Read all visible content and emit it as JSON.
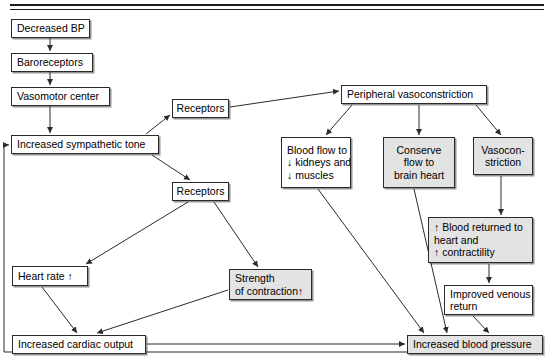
{
  "diagram": {
    "top_rule": "double-horizontal-rule",
    "box_fill_white": "#ffffff",
    "box_fill_gray": "#e3e3e3",
    "line_color": "#2b2b2b",
    "nodes": [
      {
        "id": "decreased_bp",
        "lines": [
          "Decreased BP"
        ],
        "x": 11,
        "y": 19,
        "w": 79,
        "h": 19,
        "fill": "white",
        "align": "left"
      },
      {
        "id": "baroreceptors",
        "lines": [
          "Baroreceptors"
        ],
        "x": 11,
        "y": 53,
        "w": 82,
        "h": 19,
        "fill": "white",
        "align": "left"
      },
      {
        "id": "vasomotor_center",
        "lines": [
          "Vasomotor center"
        ],
        "x": 11,
        "y": 87,
        "w": 99,
        "h": 19,
        "fill": "white",
        "align": "left"
      },
      {
        "id": "inc_symp_tone",
        "lines": [
          "Increased sympathetic tone"
        ],
        "x": 11,
        "y": 135,
        "w": 148,
        "h": 19,
        "fill": "white",
        "align": "left"
      },
      {
        "id": "receptors_upper",
        "lines": [
          "Receptors"
        ],
        "x": 172,
        "y": 99,
        "w": 57,
        "h": 19,
        "fill": "white",
        "align": "center"
      },
      {
        "id": "receptors_lower",
        "lines": [
          "Receptors"
        ],
        "x": 172,
        "y": 182,
        "w": 57,
        "h": 19,
        "fill": "white",
        "align": "center"
      },
      {
        "id": "periph_vasoconstr",
        "lines": [
          "Peripheral vasoconstriction"
        ],
        "x": 341,
        "y": 85,
        "w": 146,
        "h": 19,
        "fill": "white",
        "align": "left"
      },
      {
        "id": "blood_flow_down",
        "lines": [
          "Blood flow to",
          "↓ kidneys and",
          "↓ muscles"
        ],
        "x": 281,
        "y": 137,
        "w": 70,
        "h": 51,
        "fill": "white",
        "align": "left"
      },
      {
        "id": "conserve_flow",
        "lines": [
          "Conserve",
          "flow to",
          "brain heart"
        ],
        "x": 383,
        "y": 137,
        "w": 72,
        "h": 51,
        "fill": "gray",
        "align": "center"
      },
      {
        "id": "vasoconstriction",
        "lines": [
          "Vasocon-",
          "striction"
        ],
        "x": 473,
        "y": 137,
        "w": 60,
        "h": 38,
        "fill": "gray",
        "align": "center"
      },
      {
        "id": "blood_returned",
        "lines": [
          "↑ Blood returned to",
          "heart and",
          "↑ contractility"
        ],
        "x": 428,
        "y": 217,
        "w": 105,
        "h": 46,
        "fill": "gray",
        "align": "left"
      },
      {
        "id": "improved_venous",
        "lines": [
          "Improved venous",
          "return"
        ],
        "x": 444,
        "y": 285,
        "w": 89,
        "h": 30,
        "fill": "white",
        "align": "left"
      },
      {
        "id": "heart_rate",
        "lines": [
          "Heart rate ↑"
        ],
        "x": 12,
        "y": 266,
        "w": 76,
        "h": 20,
        "fill": "white",
        "align": "left"
      },
      {
        "id": "strength_contr",
        "lines": [
          "Strength",
          "of contraction↑"
        ],
        "x": 229,
        "y": 269,
        "w": 83,
        "h": 31,
        "fill": "gray",
        "align": "left"
      },
      {
        "id": "inc_cardiac_output",
        "lines": [
          "Increased cardiac output"
        ],
        "x": 12,
        "y": 335,
        "w": 134,
        "h": 19,
        "fill": "white",
        "align": "left"
      },
      {
        "id": "inc_blood_pressure",
        "lines": [
          "Increased blood pressure"
        ],
        "x": 407,
        "y": 335,
        "w": 136,
        "h": 19,
        "fill": "gray",
        "align": "left"
      }
    ],
    "edges": [
      {
        "id": "decreased_bp-to-baroreceptors",
        "from": "decreased_bp",
        "to": "baroreceptors",
        "path": "M 50,38 L 50,51",
        "arrow": true
      },
      {
        "id": "baroreceptors-to-vasomotor",
        "from": "baroreceptors",
        "to": "vasomotor_center",
        "path": "M 50,72 L 50,85",
        "arrow": true
      },
      {
        "id": "vasomotor-to-sympathetic-tone",
        "from": "vasomotor_center",
        "to": "inc_symp_tone",
        "path": "M 50,106 L 50,133",
        "arrow": true
      },
      {
        "id": "sympathetic-to-receptors-upper",
        "from": "inc_symp_tone",
        "to": "receptors_upper",
        "path": "M 146,134 L 170,115",
        "arrow": true
      },
      {
        "id": "sympathetic-to-receptors-lower",
        "from": "inc_symp_tone",
        "to": "receptors_lower",
        "path": "M 152,155 L 190,180",
        "arrow": true
      },
      {
        "id": "receptors-upper-to-peripheral",
        "from": "receptors_upper",
        "to": "periph_vasoconstr",
        "path": "M 230,107 L 339,91",
        "arrow": true
      },
      {
        "id": "peripheral-to-blood-flow",
        "from": "periph_vasoconstr",
        "to": "blood_flow_down",
        "path": "M 352,105 L 326,135",
        "arrow": true
      },
      {
        "id": "peripheral-to-conserve-flow",
        "from": "periph_vasoconstr",
        "to": "conserve_flow",
        "path": "M 419,105 L 419,135",
        "arrow": true
      },
      {
        "id": "peripheral-to-vasoconstriction",
        "from": "periph_vasoconstr",
        "to": "vasoconstriction",
        "path": "M 476,105 L 501,135",
        "arrow": true
      },
      {
        "id": "blood-flow-to-increased-bp",
        "from": "blood_flow_down",
        "to": "inc_blood_pressure",
        "path": "M 318,189 L 424,333",
        "arrow": true
      },
      {
        "id": "conserve-flow-to-increased-bp",
        "from": "conserve_flow",
        "to": "inc_blood_pressure",
        "path": "M 414,189 L 447,333",
        "arrow": true
      },
      {
        "id": "vasoconstriction-to-blood-returned",
        "from": "vasoconstriction",
        "to": "blood_returned",
        "path": "M 501,176 L 501,215",
        "arrow": true
      },
      {
        "id": "blood-returned-to-improved-venous",
        "from": "blood_returned",
        "to": "improved_venous",
        "path": "M 489,264 L 489,283",
        "arrow": true
      },
      {
        "id": "improved-venous-to-increased-bp",
        "from": "improved_venous",
        "to": "inc_blood_pressure",
        "path": "M 473,316 L 489,333",
        "arrow": true
      },
      {
        "id": "receptors-lower-to-heart-rate",
        "from": "receptors_lower",
        "to": "heart_rate",
        "path": "M 188,202 L 86,264",
        "arrow": true
      },
      {
        "id": "receptors-lower-to-strength",
        "from": "receptors_lower",
        "to": "strength_contr",
        "path": "M 214,202 L 258,267",
        "arrow": true
      },
      {
        "id": "heart-rate-to-cardiac-output",
        "from": "heart_rate",
        "to": "inc_cardiac_output",
        "path": "M 42,287 L 77,333",
        "arrow": true
      },
      {
        "id": "strength-to-cardiac-output",
        "from": "strength_contr",
        "to": "inc_cardiac_output",
        "path": "M 228,290 L 97,333",
        "arrow": true
      },
      {
        "id": "cardiac-output-to-increased-bp",
        "from": "inc_cardiac_output",
        "to": "inc_blood_pressure",
        "path": "M 147,344 L 405,344",
        "arrow": true
      },
      {
        "id": "increased-bp-feedback-to-sympathetic-tone",
        "from": "inc_blood_pressure",
        "to": "inc_symp_tone",
        "path": "M 407,352 L 4,352 L 4,145 L 9,145",
        "arrow": true
      }
    ]
  }
}
